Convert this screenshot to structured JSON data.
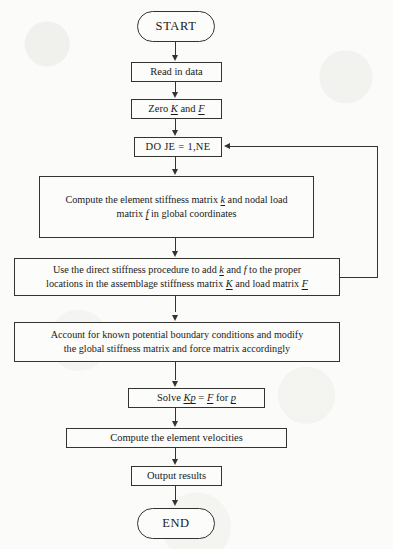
{
  "diagram": {
    "type": "flowchart",
    "line_color": "#33332f",
    "background_color": "#fbfbf9"
  },
  "nodes": {
    "start": {
      "label": "START",
      "shape": "terminal"
    },
    "read_data": {
      "label": "Read in data",
      "shape": "process"
    },
    "zero": {
      "shape": "process",
      "parts": {
        "p1": "Zero ",
        "v1": "K",
        "p2": " and ",
        "v2": "F"
      }
    },
    "do_loop": {
      "label": "DO JE  =  1,NE",
      "shape": "process"
    },
    "compute_element": {
      "shape": "process",
      "parts": {
        "l1a": "Compute the element stiffness matrix ",
        "l1v": "k",
        "l1b": " and nodal load",
        "l2a": "matrix ",
        "l2v": "f",
        "l2b": " in global coordinates"
      }
    },
    "direct_stiffness": {
      "shape": "process",
      "parts": {
        "l1a": "Use the direct stiffness procedure to add ",
        "l1v1": "k",
        "l1b": " and ",
        "l1v2": "f",
        "l1c": " to the proper",
        "l2a": "locations in the assemblage stiffness matrix ",
        "l2v1": "K",
        "l2b": " and load matrix ",
        "l2v2": "F"
      }
    },
    "boundary_conditions": {
      "shape": "process",
      "parts": {
        "l1": "Account for known potential boundary conditions and modify",
        "l2": "the global stiffness matrix and force matrix accordingly"
      }
    },
    "solve": {
      "shape": "process",
      "parts": {
        "p1": "Solve ",
        "v1": "K",
        "v2": "p",
        "p2": " = ",
        "v3": "F",
        "p3": " for ",
        "v4": "p"
      }
    },
    "compute_velocities": {
      "label": "Compute the element velocities",
      "shape": "process"
    },
    "output_results": {
      "label": "Output results",
      "shape": "process"
    },
    "end": {
      "label": "END",
      "shape": "terminal"
    }
  },
  "edges": [
    {
      "name": "start-to-read-data",
      "from": "start",
      "to": "read_data",
      "kind": "straight-down"
    },
    {
      "name": "read-data-to-zero",
      "from": "read_data",
      "to": "zero",
      "kind": "straight-down"
    },
    {
      "name": "zero-to-do-loop",
      "from": "zero",
      "to": "do_loop",
      "kind": "straight-down"
    },
    {
      "name": "do-loop-to-compute-element",
      "from": "do_loop",
      "to": "compute_element",
      "kind": "straight-down"
    },
    {
      "name": "compute-element-to-direct-stiffness",
      "from": "compute_element",
      "to": "direct_stiffness",
      "kind": "straight-down"
    },
    {
      "name": "direct-stiffness-to-boundary-conditions",
      "from": "direct_stiffness",
      "to": "boundary_conditions",
      "kind": "straight-down"
    },
    {
      "name": "boundary-conditions-to-solve",
      "from": "boundary_conditions",
      "to": "solve",
      "kind": "straight-down"
    },
    {
      "name": "solve-to-compute-velocities",
      "from": "solve",
      "to": "compute_velocities",
      "kind": "straight-down"
    },
    {
      "name": "compute-velocities-to-output-results",
      "from": "compute_velocities",
      "to": "output_results",
      "kind": "straight-down"
    },
    {
      "name": "output-results-to-end",
      "from": "output_results",
      "to": "end",
      "kind": "straight-down"
    },
    {
      "name": "loop-back-to-do-loop",
      "from": "direct_stiffness",
      "to": "do_loop",
      "kind": "feedback-right-up-left"
    }
  ]
}
